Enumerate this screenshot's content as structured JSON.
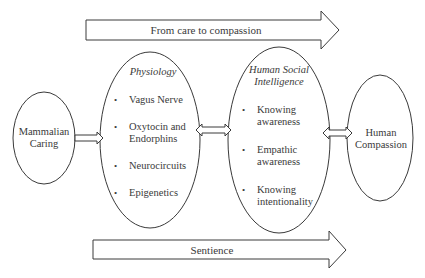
{
  "arrows": {
    "top": {
      "label": "From care to compassion"
    },
    "bottom": {
      "label": "Sentience"
    }
  },
  "nodes": {
    "mammalian": {
      "line1": "Mammalian",
      "line2": "Caring"
    },
    "physiology": {
      "title": "Physiology",
      "items": [
        {
          "line1": "Vagus Nerve"
        },
        {
          "line1": "Oxytocin and",
          "line2": "Endorphins"
        },
        {
          "line1": "Neurocircuits"
        },
        {
          "line1": "Epigenetics"
        }
      ]
    },
    "social": {
      "title1": "Human Social",
      "title2": "Intelligence",
      "items": [
        {
          "line1": "Knowing",
          "line2": "awareness"
        },
        {
          "line1": "Empathic",
          "line2": "awareness"
        },
        {
          "line1": "Knowing",
          "line2": "intentionality"
        }
      ]
    },
    "compassion": {
      "line1": "Human",
      "line2": "Compassion"
    }
  },
  "connectors": [
    {
      "from": "Mammalian Caring",
      "to": "Physiology",
      "type": "single"
    },
    {
      "from": "Physiology",
      "to": "Human Social Intelligence",
      "type": "double"
    },
    {
      "from": "Human Social Intelligence",
      "to": "Human Compassion",
      "type": "double"
    }
  ],
  "colors": {
    "stroke": "#3a3a3a",
    "background": "#ffffff",
    "text": "#3a3a3a"
  }
}
